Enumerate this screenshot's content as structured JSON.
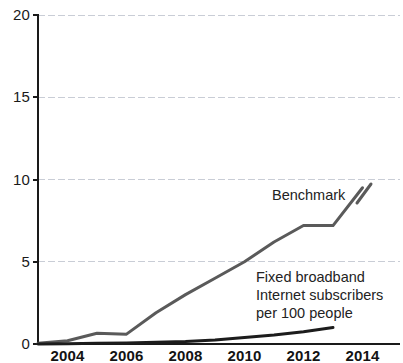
{
  "chart_data": {
    "type": "line",
    "title": "",
    "subtitle": "",
    "xlabel": "",
    "ylabel": "",
    "xlim": [
      2003,
      2014
    ],
    "ylim": [
      0,
      20
    ],
    "grid": true,
    "grid_axis": "y",
    "legend_position": "inline-annotation",
    "x": [
      2003,
      2004,
      2005,
      2006,
      2007,
      2008,
      2009,
      2010,
      2011,
      2012,
      2013,
      2014
    ],
    "x_tick_labels": [
      "2004",
      "2006",
      "2008",
      "2010",
      "2012",
      "2014"
    ],
    "x_tick_values": [
      2004,
      2006,
      2008,
      2010,
      2012,
      2014
    ],
    "y_tick_labels": [
      "0",
      "5",
      "10",
      "15",
      "20"
    ],
    "y_tick_values": [
      0,
      5,
      10,
      15,
      20
    ],
    "series": [
      {
        "name": "Benchmark",
        "color": "#5a5a5a",
        "line_width": 3,
        "values": [
          0.05,
          0.2,
          0.65,
          0.6,
          1.9,
          3.0,
          4.0,
          5.0,
          6.2,
          7.2,
          7.2,
          9.5
        ]
      },
      {
        "name": "Fixed broadband Internet subscribers per 100 people",
        "color": "#1c1c1c",
        "line_width": 3,
        "values": [
          0.0,
          0.02,
          0.04,
          0.06,
          0.1,
          0.15,
          0.25,
          0.4,
          0.55,
          0.75,
          1.0,
          null
        ]
      }
    ],
    "annotations": [
      {
        "id": "benchmark-annotation",
        "lines": [
          "Benchmark"
        ],
        "x_px": 272,
        "y_px": 186
      },
      {
        "id": "broadband-annotation",
        "lines": [
          "Fixed broadband",
          "Internet subscribers",
          "per 100 people"
        ],
        "x_px": 256,
        "y_px": 268
      }
    ],
    "colors": {
      "background": "#ffffff",
      "axis": "#1a1a1a",
      "gridline": "#c9cdd6",
      "benchmark_series": "#5a5a5a",
      "broadband_series": "#1c1c1c",
      "tick_text": "#131313"
    },
    "axis_geometry": {
      "plot_left_px": 38,
      "plot_right_px": 400,
      "baseline_y_px": 344,
      "top_y_px": 15,
      "px_per_year": 29.5,
      "px_per_unit_y": 16.45
    }
  }
}
